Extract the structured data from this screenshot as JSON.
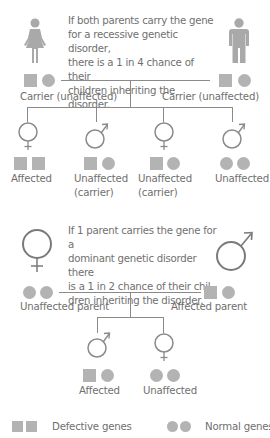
{
  "recessive": {
    "description": [
      "If both parents carry the gene",
      "for a recessive genetic disorder,",
      "there is a 1 in 4 chance of their",
      "children inheriting the disorder."
    ],
    "parents": [
      {
        "sex": "female",
        "icon": "female-figure-icon",
        "genes": [
          "defective",
          "normal"
        ],
        "label": "Carrier (unaffected)"
      },
      {
        "sex": "male",
        "icon": "male-figure-icon",
        "genes": [
          "defective",
          "normal"
        ],
        "label": "Carrier (unaffected)"
      }
    ],
    "children": [
      {
        "sex": "female",
        "genes": [
          "defective",
          "defective"
        ],
        "label": "Affected",
        "sublabel": ""
      },
      {
        "sex": "male",
        "genes": [
          "defective",
          "normal"
        ],
        "label": "Unaffected",
        "sublabel": "(carrier)"
      },
      {
        "sex": "female",
        "genes": [
          "defective",
          "normal"
        ],
        "label": "Unaffected",
        "sublabel": "(carrier)"
      },
      {
        "sex": "male",
        "genes": [
          "normal",
          "normal"
        ],
        "label": "Unaffected",
        "sublabel": ""
      }
    ]
  },
  "dominant": {
    "description": [
      "If 1 parent carries the gene for a",
      "dominant genetic disorder there",
      "is a 1 in 2 chance of their chil-",
      "dren inheriting the disorder."
    ],
    "parents": [
      {
        "sex": "female",
        "icon": "female-symbol-icon",
        "genes": [
          "normal",
          "normal"
        ],
        "label": "Unaffected parent"
      },
      {
        "sex": "male",
        "icon": "male-symbol-icon",
        "genes": [
          "defective",
          "normal"
        ],
        "label": "Affected parent"
      }
    ],
    "children": [
      {
        "sex": "male",
        "genes": [
          "defective",
          "normal"
        ],
        "label": "Affected"
      },
      {
        "sex": "female",
        "genes": [
          "normal",
          "normal"
        ],
        "label": "Unaffected"
      }
    ]
  },
  "legend": {
    "defective": {
      "shape": "square",
      "label": "Defective genes"
    },
    "normal": {
      "shape": "circle",
      "label": "Normal genes"
    }
  },
  "colors": {
    "gene_fill": "#b3b3b3",
    "symbol_stroke": "#8a8a8a",
    "big_symbol_stroke": "#7a7a7a",
    "figure_fill": "#a8a8a8",
    "text": "#6f6f6f"
  }
}
